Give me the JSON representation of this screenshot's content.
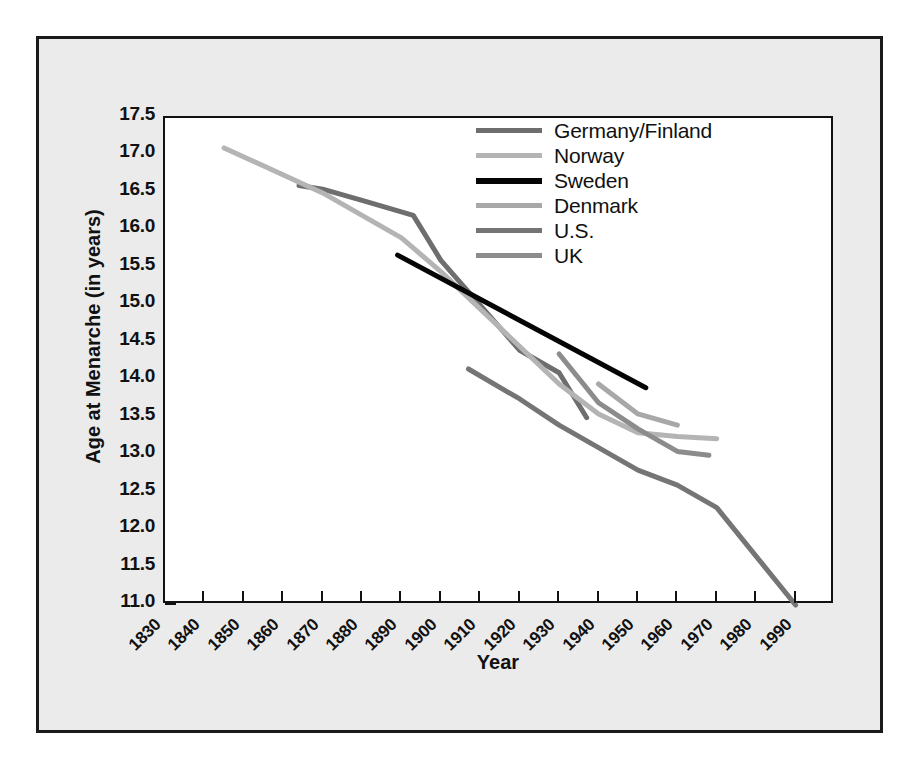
{
  "chart_data": {
    "type": "line",
    "title": "",
    "xlabel": "Year",
    "ylabel": "Age at Menarche (in years)",
    "xlim": [
      1830,
      2000
    ],
    "ylim": [
      11.0,
      17.5
    ],
    "grid": false,
    "legend_position": "upper-center-right",
    "x_ticks": [
      1830,
      1840,
      1850,
      1860,
      1870,
      1880,
      1890,
      1900,
      1910,
      1920,
      1930,
      1940,
      1950,
      1960,
      1970,
      1980,
      1990
    ],
    "y_ticks": [
      11.0,
      11.5,
      12.0,
      12.5,
      13.0,
      13.5,
      14.0,
      14.5,
      15.0,
      15.5,
      16.0,
      16.5,
      17.0,
      17.5
    ],
    "x_tick_labels": [
      "1830",
      "1840",
      "1850",
      "1860",
      "1870",
      "1880",
      "1890",
      "1900",
      "1910",
      "1920",
      "1930",
      "1940",
      "1950",
      "1960",
      "1970",
      "1980",
      "1990"
    ],
    "y_tick_labels": [
      "17.5",
      "17.0",
      "16.5",
      "16.0",
      "15.5",
      "15.0",
      "14.5",
      "14.0",
      "13.5",
      "13.0",
      "12.5",
      "12.0",
      "11.5",
      "11.0"
    ],
    "series": [
      {
        "name": "Germany/Finland",
        "color": "#6e6e6e",
        "width": 5,
        "x": [
          1864,
          1870,
          1880,
          1893,
          1900,
          1920,
          1930,
          1937
        ],
        "y": [
          16.6,
          16.55,
          16.4,
          16.2,
          15.6,
          14.4,
          14.1,
          13.5
        ]
      },
      {
        "name": "Norway",
        "color": "#b4b4b4",
        "width": 5,
        "x": [
          1845,
          1870,
          1890,
          1900,
          1920,
          1930,
          1940,
          1950,
          1960,
          1970
        ],
        "y": [
          17.1,
          16.5,
          15.9,
          15.45,
          14.45,
          13.95,
          13.55,
          13.3,
          13.25,
          13.22
        ]
      },
      {
        "name": "Sweden",
        "color": "#050505",
        "width": 5,
        "x": [
          1889,
          1952
        ],
        "y": [
          15.67,
          13.9
        ]
      },
      {
        "name": "Denmark",
        "color": "#a8a8a8",
        "width": 5,
        "x": [
          1940,
          1950,
          1960
        ],
        "y": [
          13.95,
          13.55,
          13.4
        ]
      },
      {
        "name": "U.S.",
        "color": "#757575",
        "width": 5,
        "x": [
          1907,
          1920,
          1930,
          1940,
          1950,
          1960,
          1970,
          1990
        ],
        "y": [
          14.15,
          13.75,
          13.4,
          13.1,
          12.8,
          12.6,
          12.3,
          11.0
        ]
      },
      {
        "name": "UK",
        "color": "#8c8c8c",
        "width": 5,
        "x": [
          1930,
          1940,
          1950,
          1960,
          1968
        ],
        "y": [
          14.35,
          13.7,
          13.35,
          13.05,
          13.0
        ]
      }
    ]
  },
  "legend": {
    "entries": [
      {
        "label": "Germany/Finland",
        "color": "#6e6e6e"
      },
      {
        "label": "Norway",
        "color": "#b4b4b4"
      },
      {
        "label": "Sweden",
        "color": "#050505"
      },
      {
        "label": "Denmark",
        "color": "#a8a8a8"
      },
      {
        "label": "U.S.",
        "color": "#757575"
      },
      {
        "label": "UK",
        "color": "#8c8c8c"
      }
    ]
  },
  "axes": {
    "x_title": "Year",
    "y_title": "Age at Menarche (in years)"
  },
  "colors": {
    "figure_background": "#ebebeb",
    "plot_background": "#ffffff",
    "frame": "#1a1a1a",
    "axis": "#111111",
    "text": "#111111"
  }
}
